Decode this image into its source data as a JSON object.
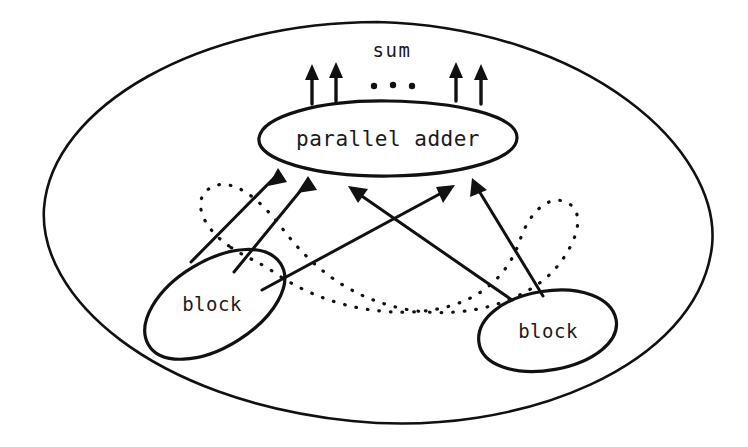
{
  "diagram": {
    "canvas": {
      "width": 748,
      "height": 447
    },
    "colors": {
      "ink": "#111111",
      "background": "#ffffff",
      "text": "#1a1a1a"
    },
    "outer_boundary": {
      "name": "outer-enclosure-ellipse",
      "shape": "ellipse",
      "cx": 378,
      "cy": 222,
      "rx": 335,
      "ry": 200
    },
    "nodes": [
      {
        "id": "parallel-adder",
        "label": "parallel adder",
        "shape": "ellipse",
        "cx": 388,
        "cy": 138,
        "rx": 130,
        "ry": 38,
        "rotation": -1
      },
      {
        "id": "block-left",
        "label": "block",
        "shape": "ellipse",
        "cx": 215,
        "cy": 304,
        "rx": 78,
        "ry": 43,
        "rotation": -31
      },
      {
        "id": "block-right",
        "label": "block",
        "shape": "ellipse",
        "cx": 548,
        "cy": 331,
        "rx": 70,
        "ry": 40,
        "rotation": -9
      }
    ],
    "output_label": {
      "id": "sum-label",
      "text": "sum",
      "x": 389,
      "y": 60
    },
    "output_arrows": {
      "name": "sum-output-arrows",
      "count": 4,
      "x_positions": [
        312,
        336,
        456,
        481
      ],
      "y_top": 66,
      "y_bottom": 104,
      "ellipsis_dots": [
        {
          "x": 374,
          "y": 85
        },
        {
          "x": 393,
          "y": 85
        },
        {
          "x": 412,
          "y": 85
        }
      ]
    },
    "input_arrows": {
      "name": "block-to-adder-arrows",
      "count": 5,
      "targets_on_adder": [
        {
          "x": 274,
          "y": 170
        },
        {
          "x": 304,
          "y": 178
        },
        {
          "x": 352,
          "y": 185
        },
        {
          "x": 444,
          "y": 183
        },
        {
          "x": 472,
          "y": 177
        }
      ],
      "sources": [
        {
          "block": "block-left",
          "x": 195,
          "y": 258
        },
        {
          "block": "block-left",
          "x": 236,
          "y": 268
        },
        {
          "block": "block-right",
          "x": 510,
          "y": 296
        },
        {
          "block": "block-left",
          "x": 262,
          "y": 283
        },
        {
          "block": "block-right",
          "x": 540,
          "y": 292
        }
      ]
    },
    "dotted_connector": {
      "name": "dotted-interconnect-loop",
      "description": "dotted rounded loop linking the two block nodes through the middle region",
      "style": "dotted"
    },
    "legend_notes": []
  }
}
